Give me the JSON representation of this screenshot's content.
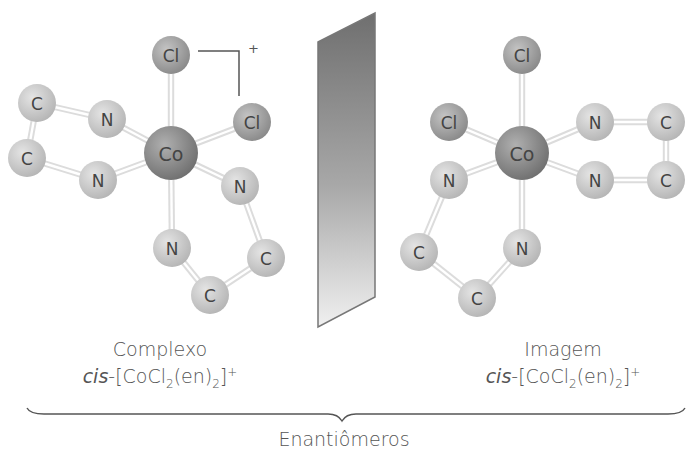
{
  "figure": {
    "mirror_plane": {
      "label": "mirror"
    },
    "left_molecule": {
      "name": "Complexo",
      "formula": {
        "prefix": "cis",
        "dash": "-",
        "open": "[CoCl",
        "sub1": "2",
        "mid": "(en)",
        "sub2": "2",
        "close": "]",
        "charge": "+"
      },
      "charge_bracket": "+",
      "atoms": [
        {
          "id": "Co",
          "label": "Co",
          "x": 171,
          "y": 153,
          "r": 27,
          "type": "metal"
        },
        {
          "id": "Cl1",
          "label": "Cl",
          "x": 171,
          "y": 55,
          "r": 19,
          "type": "cl"
        },
        {
          "id": "Cl2",
          "label": "Cl",
          "x": 252,
          "y": 122,
          "r": 19,
          "type": "cl"
        },
        {
          "id": "N1",
          "label": "N",
          "x": 107,
          "y": 119,
          "r": 19,
          "type": "n"
        },
        {
          "id": "N2",
          "label": "N",
          "x": 98,
          "y": 180,
          "r": 19,
          "type": "n"
        },
        {
          "id": "N3",
          "label": "N",
          "x": 240,
          "y": 186,
          "r": 19,
          "type": "n"
        },
        {
          "id": "N4",
          "label": "N",
          "x": 172,
          "y": 248,
          "r": 19,
          "type": "n"
        },
        {
          "id": "C1",
          "label": "C",
          "x": 37,
          "y": 103,
          "r": 19,
          "type": "c"
        },
        {
          "id": "C2",
          "label": "C",
          "x": 27,
          "y": 158,
          "r": 19,
          "type": "c"
        },
        {
          "id": "C3",
          "label": "C",
          "x": 266,
          "y": 258,
          "r": 19,
          "type": "c"
        },
        {
          "id": "C4",
          "label": "C",
          "x": 210,
          "y": 295,
          "r": 19,
          "type": "c"
        }
      ],
      "bonds": [
        [
          "Co",
          "Cl1"
        ],
        [
          "Co",
          "Cl2"
        ],
        [
          "Co",
          "N1"
        ],
        [
          "Co",
          "N2"
        ],
        [
          "Co",
          "N3"
        ],
        [
          "Co",
          "N4"
        ],
        [
          "N1",
          "C1"
        ],
        [
          "C1",
          "C2"
        ],
        [
          "C2",
          "N2"
        ],
        [
          "N3",
          "C3"
        ],
        [
          "C3",
          "C4"
        ],
        [
          "C4",
          "N4"
        ]
      ]
    },
    "right_molecule": {
      "name": "Imagem",
      "formula": {
        "prefix": "cis",
        "dash": "-",
        "open": "[CoCl",
        "sub1": "2",
        "mid": "(en)",
        "sub2": "2",
        "close": "]",
        "charge": "+"
      },
      "atoms": [
        {
          "id": "Co",
          "label": "Co",
          "x": 522,
          "y": 153,
          "r": 27,
          "type": "metal"
        },
        {
          "id": "Cl1",
          "label": "Cl",
          "x": 522,
          "y": 55,
          "r": 19,
          "type": "cl"
        },
        {
          "id": "Cl2",
          "label": "Cl",
          "x": 449,
          "y": 122,
          "r": 19,
          "type": "cl"
        },
        {
          "id": "N1",
          "label": "N",
          "x": 595,
          "y": 122,
          "r": 19,
          "type": "n"
        },
        {
          "id": "N2",
          "label": "N",
          "x": 595,
          "y": 180,
          "r": 19,
          "type": "n"
        },
        {
          "id": "N3",
          "label": "N",
          "x": 449,
          "y": 180,
          "r": 19,
          "type": "n"
        },
        {
          "id": "N4",
          "label": "N",
          "x": 522,
          "y": 248,
          "r": 19,
          "type": "n"
        },
        {
          "id": "C1",
          "label": "C",
          "x": 666,
          "y": 122,
          "r": 19,
          "type": "c"
        },
        {
          "id": "C2",
          "label": "C",
          "x": 666,
          "y": 180,
          "r": 19,
          "type": "c"
        },
        {
          "id": "C3",
          "label": "C",
          "x": 419,
          "y": 252,
          "r": 19,
          "type": "c"
        },
        {
          "id": "C4",
          "label": "C",
          "x": 477,
          "y": 298,
          "r": 19,
          "type": "c"
        }
      ],
      "bonds": [
        [
          "Co",
          "Cl1"
        ],
        [
          "Co",
          "Cl2"
        ],
        [
          "Co",
          "N1"
        ],
        [
          "Co",
          "N2"
        ],
        [
          "Co",
          "N3"
        ],
        [
          "Co",
          "N4"
        ],
        [
          "N1",
          "C1"
        ],
        [
          "C1",
          "C2"
        ],
        [
          "C2",
          "N2"
        ],
        [
          "N3",
          "C3"
        ],
        [
          "C3",
          "C4"
        ],
        [
          "C4",
          "N4"
        ]
      ]
    },
    "brace_label": "Enantiômeros",
    "colors": {
      "metal": "#8a8a8a",
      "cl": "#a5a5a5",
      "n": "#c8c8c8",
      "c": "#c8c8c8",
      "bond": "#dcdcdc",
      "text": "#555555",
      "mirror_dark": "#6f6f6f",
      "mirror_light": "#f0f0f0"
    }
  }
}
